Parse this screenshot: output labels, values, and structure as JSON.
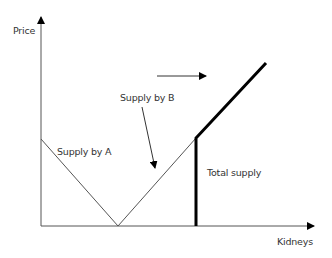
{
  "diagram": {
    "axes": {
      "y_label": "Price",
      "x_label": "Kidneys"
    },
    "labels": {
      "supply_a": "Supply by A",
      "supply_b": "Supply by B",
      "total_supply": "Total supply"
    },
    "colors": {
      "line": "#555555",
      "bold_line": "#000000",
      "text": "#333333"
    }
  }
}
